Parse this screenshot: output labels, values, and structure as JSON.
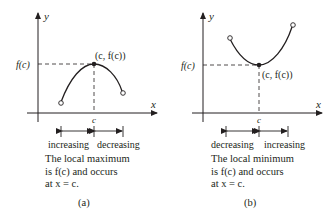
{
  "diagrams": [
    {
      "id": "a",
      "panel_label": "(a)",
      "axis_y_label": "y",
      "axis_x_label": "x",
      "level_label": "f(c)",
      "point_label": "(c, f(c))",
      "tick_label": "c",
      "interval_left": "increasing",
      "interval_right": "decreasing",
      "caption_lines": [
        "The local maximum",
        "is f(c) and occurs",
        "at x = c."
      ],
      "extremum": "maximum"
    },
    {
      "id": "b",
      "panel_label": "(b)",
      "axis_y_label": "y",
      "axis_x_label": "x",
      "level_label": "f(c)",
      "point_label": "(c, f(c))",
      "tick_label": "c",
      "interval_left": "decreasing",
      "interval_right": "increasing",
      "caption_lines": [
        "The local minimum",
        "is f(c) and occurs",
        "at x = c."
      ],
      "extremum": "minimum"
    }
  ],
  "colors": {
    "ink": "#231f20",
    "background": "#ffffff"
  }
}
